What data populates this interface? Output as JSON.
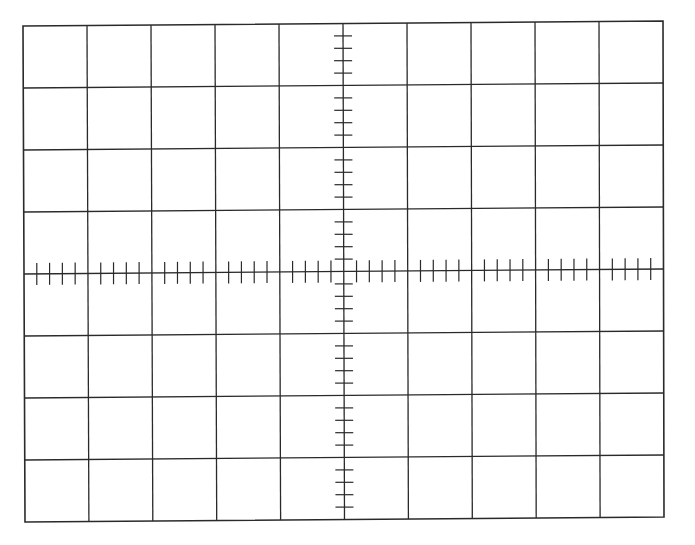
{
  "graticule": {
    "description": "Oscilloscope screen graticule",
    "divisions_horizontal": 10,
    "divisions_vertical": 8,
    "minor_ticks_per_division": 4,
    "corners": {
      "top_left": [
        23,
        26
      ],
      "top_right": [
        663,
        21
      ],
      "bottom_left": [
        25,
        522
      ],
      "bottom_right": [
        664,
        517
      ]
    },
    "tick_half_length_on_horizontal_axis": 11,
    "tick_half_length_on_vertical_axis": 9,
    "line_color": "#2a2a2a",
    "background_color": "#ffffff",
    "border_width": 1.6,
    "grid_line_width": 1.3,
    "tick_width": 1.2
  }
}
